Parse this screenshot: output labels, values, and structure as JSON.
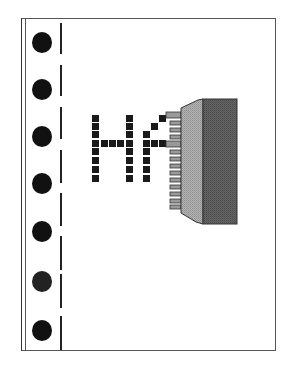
{
  "icon": {
    "subject": "document-with-connector-icon",
    "letters_shown": "H",
    "partial_letter": "A",
    "colors": {
      "ink": "#1a1a1a",
      "page_border": "#555555",
      "connector_light_face": "#a8a8a8",
      "connector_dark_face": "#5e5e5e",
      "pins": "#9a9a9a",
      "background": "#ffffff"
    },
    "binder_holes": 7
  }
}
